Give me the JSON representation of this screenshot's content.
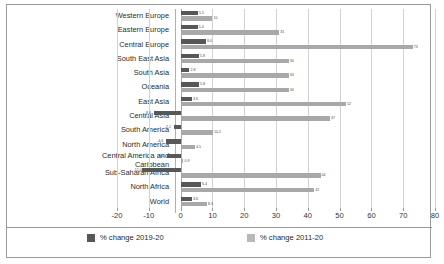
{
  "chart_data": {
    "type": "bar",
    "orientation": "horizontal",
    "title": "",
    "subtitle": "",
    "xlabel": "",
    "ylabel": "",
    "xlim": [
      -20,
      80
    ],
    "xticks": [
      -20,
      -10,
      0,
      10,
      20,
      30,
      40,
      50,
      60,
      70,
      80
    ],
    "xtick_labels": [
      "-20",
      "-10",
      "0",
      "10",
      "20",
      "30",
      "40",
      "50",
      "60",
      "70",
      "80"
    ],
    "grid": true,
    "legend_position": "bottom",
    "categories": [
      "Western Europe",
      "Eastern Europe",
      "Central Europe",
      "South East Asia",
      "South Asia",
      "Oceania",
      "East Asia",
      "Central Asia",
      "South America",
      "North America",
      "Central America and\nCaribbean",
      "Sub-Saharan Africa",
      "North Africa",
      "World"
    ],
    "series": [
      {
        "name": "% change 2019-20",
        "color": "#575757",
        "values": [
          5.5,
          5.4,
          8.0,
          5.8,
          2.8,
          5.8,
          3.6,
          -8.4,
          -2.1,
          -4.6,
          -4.4,
          -12.0,
          6.4,
          3.6
        ],
        "labels": [
          "5.5",
          "5.4",
          "8.0",
          "5.8",
          "2.8",
          "5.8",
          "3.6",
          "-8.4",
          "-2.1",
          "-4.6",
          "-4.4",
          "-12.0",
          "6.4",
          "3.6"
        ]
      },
      {
        "name": "% change 2011-20",
        "color": "#a8a8a8",
        "values": [
          10.0,
          31.0,
          73.0,
          34.0,
          34.0,
          34.0,
          52.0,
          47.0,
          10.2,
          4.5,
          0.9,
          44.0,
          42.0,
          8.3
        ],
        "labels": [
          "10",
          "31",
          "73",
          "34",
          "34",
          "34",
          "52",
          "47",
          "10.2",
          "4.5",
          "0.9",
          "44",
          "42",
          "8.3"
        ]
      }
    ],
    "legend_entries": [
      {
        "label": "% change 2019-20",
        "color": "#575757"
      },
      {
        "label": "% change 2011-20",
        "color": "#b8b8b8"
      }
    ]
  }
}
